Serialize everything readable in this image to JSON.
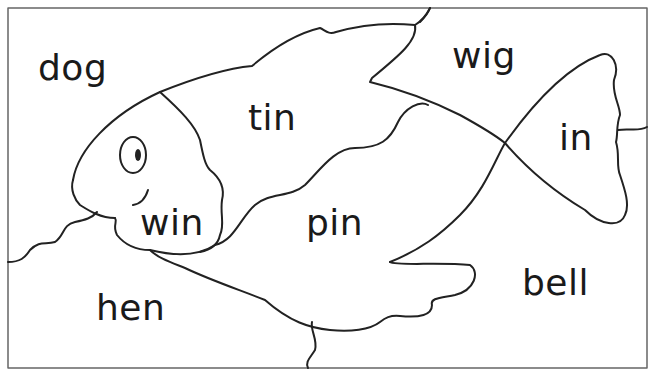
{
  "puzzle": {
    "title": "Fish word puzzle",
    "colors": {
      "line": "#222222",
      "border": "#666666",
      "background": "#ffffff",
      "text": "#1a1a1a"
    },
    "pieces": [
      {
        "word": "dog",
        "x": 38,
        "y": 50
      },
      {
        "word": "tin",
        "x": 248,
        "y": 100
      },
      {
        "word": "wig",
        "x": 452,
        "y": 38
      },
      {
        "word": "in",
        "x": 559,
        "y": 120
      },
      {
        "word": "win",
        "x": 140,
        "y": 205
      },
      {
        "word": "pin",
        "x": 306,
        "y": 205
      },
      {
        "word": "hen",
        "x": 96,
        "y": 290
      },
      {
        "word": "bell",
        "x": 522,
        "y": 265
      }
    ]
  }
}
